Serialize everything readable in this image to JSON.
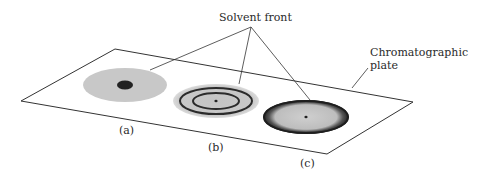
{
  "labels": {
    "solvent_front": "Solvent front",
    "plate_line1": "Chromatographic",
    "plate_line2": "plate",
    "spot_a": "(a)",
    "spot_b": "(b)",
    "spot_c": "(c)"
  },
  "colors": {
    "background": "#ffffff",
    "line": "#333333",
    "spot_fill": "#c8c8c8",
    "spot_dark": "#222222",
    "ring": "#2b2b2b"
  },
  "spots": [
    {
      "id": "a",
      "description": "light gray disc with dark central spot"
    },
    {
      "id": "b",
      "description": "light gray disc with two concentric dark rings and central dot"
    },
    {
      "id": "c",
      "description": "gray disc with thick dark outer rim and small central dot"
    }
  ]
}
